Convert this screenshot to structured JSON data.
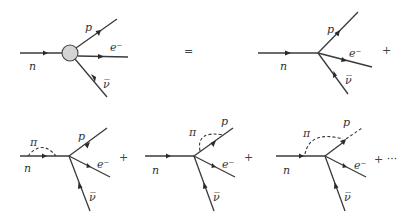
{
  "particles": {
    "neutron": "n",
    "proton": "p",
    "electron": "e⁻",
    "antineutrino": "ν̅",
    "pion": "π"
  },
  "operators": {
    "equals": "=",
    "plus": "+",
    "plus_ellipsis": "+ ···"
  },
  "diagrams": [
    {
      "id": "full-vertex",
      "description": "effective vertex (blob)"
    },
    {
      "id": "tree-level",
      "description": "point vertex"
    },
    {
      "id": "pion-on-neutron",
      "description": "pion loop on incoming neutron"
    },
    {
      "id": "pion-on-proton",
      "description": "pion loop on outgoing proton"
    },
    {
      "id": "pion-exchange",
      "description": "pion exchanged between neutron and proton"
    }
  ]
}
